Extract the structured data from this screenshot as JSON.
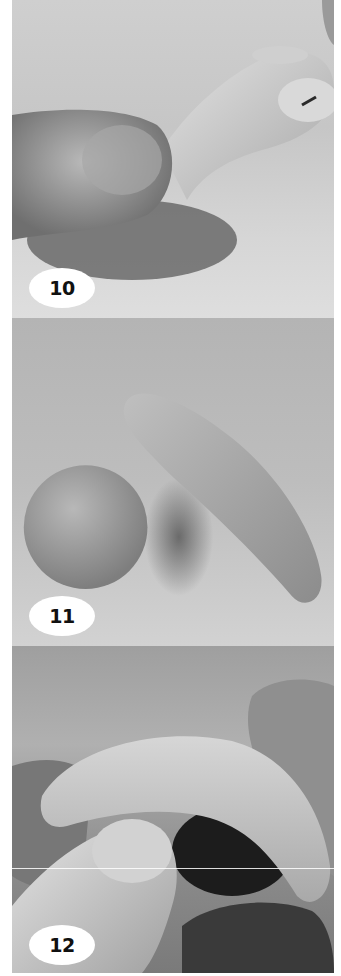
{
  "figure": {
    "steps": [
      {
        "number": "10",
        "scene": "Thumb and forefinger pinching a clay finger-like shape with a nail detail",
        "background_color": "#c8c8c8"
      },
      {
        "number": "11",
        "scene": "A clay ball next to an elongated curved clay roll",
        "background_color": "#b8b8b8"
      },
      {
        "number": "12",
        "scene": "Fingers bending a flattened curved piece of clay",
        "background_color": "#a4a4a4"
      }
    ],
    "badge_color": "#ffffff",
    "badge_text_color": "#111111"
  }
}
